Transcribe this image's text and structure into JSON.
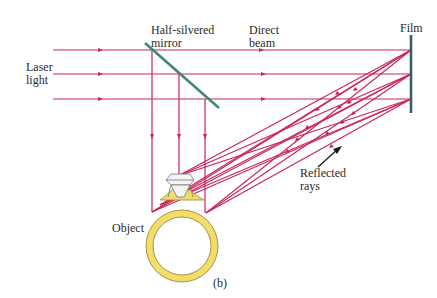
{
  "figure": {
    "caption": "(b)",
    "labels": {
      "laser_line1": "Laser",
      "laser_line2": "light",
      "mirror_line1": "Half-silvered",
      "mirror_line2": "mirror",
      "direct_line1": "Direct",
      "direct_line2": "beam",
      "film": "Film",
      "reflected_line1": "Reflected",
      "reflected_line2": "rays",
      "object": "Object"
    },
    "colors": {
      "beam": "#c8245a",
      "mirror": "#3f8a6e",
      "film": "#3c5a68",
      "ring_gold": "#f2dc6a",
      "ring_outline": "#9a8a3a",
      "diamond": "#f4f4f4",
      "diamond_outline": "#777777",
      "text": "#2a2a2a"
    },
    "beams_y": [
      50,
      74,
      99
    ],
    "film_x": 411,
    "vertical_beams_x": [
      152,
      179,
      205
    ]
  }
}
